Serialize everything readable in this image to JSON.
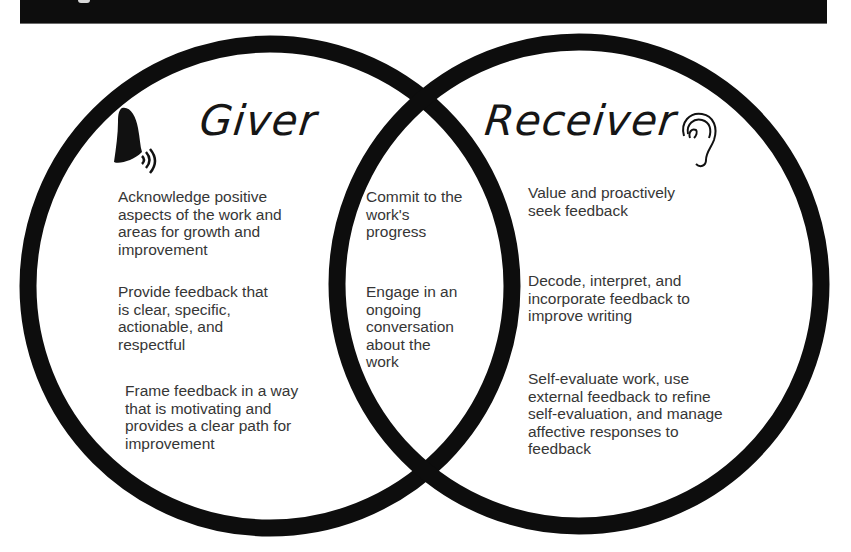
{
  "diagram": {
    "type": "venn",
    "colors": {
      "stroke": "#0d0d0d",
      "text": "#363636",
      "heading": "#161616",
      "background": "#ffffff",
      "top_bar": "#0d0d0d"
    },
    "left": {
      "title": "Giver",
      "icon": "speaking-head-icon",
      "items": [
        "Acknowledge positive\naspects of the work and\nareas for growth and\nimprovement",
        "Provide feedback that\nis clear, specific,\nactionable, and\nrespectful",
        "Frame feedback in a way\nthat is motivating and\nprovides a clear path for\nimprovement"
      ]
    },
    "overlap": {
      "items": [
        "Commit to the\nwork's\nprogress",
        "Engage in an\nongoing\nconversation\nabout the\nwork"
      ]
    },
    "right": {
      "title": "Receiver",
      "icon": "ear-icon",
      "items": [
        "Value and proactively\nseek feedback",
        "Decode, interpret, and\nincorporate feedback to\nimprove writing",
        "Self-evaluate work, use\nexternal feedback to refine\nself-evaluation, and manage\naffective responses to\nfeedback"
      ]
    }
  }
}
